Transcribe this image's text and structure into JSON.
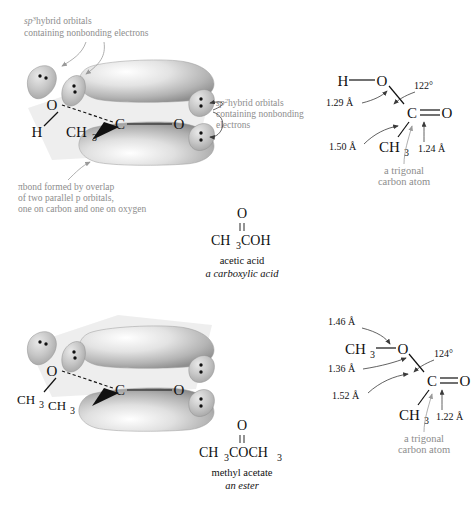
{
  "figure": {
    "background_color": "#ffffff",
    "text_color": "#111111",
    "gray_label_color": "#8d8d8d",
    "orbital_lobe_color": "#b9b9b9",
    "plane_color": "#ebebeb"
  },
  "panels": [
    {
      "id": "acetic-acid",
      "orbital_diagram": {
        "atoms": [
          {
            "symbol": "O",
            "sub": ""
          },
          {
            "symbol": "H",
            "sub": ""
          },
          {
            "symbol": "CH",
            "sub": "3"
          },
          {
            "symbol": "C",
            "sub": ""
          },
          {
            "symbol": "O",
            "sub": ""
          }
        ],
        "lone_pair_count": 4,
        "pi_lobes": 2
      },
      "annotations": [
        {
          "id": "sp3-label",
          "lines": [
            "hybrid orbitals",
            "containing nonbonding electrons"
          ],
          "prefix_base": "sp",
          "prefix_exp": "3"
        },
        {
          "id": "sp2-label",
          "lines": [
            "hybrid orbitals",
            "containing nonbonding",
            "electrons"
          ],
          "prefix_base": "sp",
          "prefix_exp": "2"
        },
        {
          "id": "pi-bond-label",
          "lines": [
            "bond formed by overlap",
            "of two parallel p orbitals,",
            "one on carbon and one on oxygen"
          ],
          "symbol": "π"
        }
      ],
      "structure": {
        "atoms": {
          "left": "H",
          "o_hydroxyl": "O",
          "carbon": "C",
          "o_carbonyl": "O",
          "methyl_base": "CH",
          "methyl_sub": "3"
        },
        "angle": "122°",
        "bond_lengths": [
          {
            "id": "o-h-to-c",
            "value": "1.29 Å"
          },
          {
            "id": "c-ch3",
            "value": "1.50 Å"
          },
          {
            "id": "c-double-o",
            "value": "1.24 Å"
          }
        ],
        "trigonal_note": [
          "a trigonal",
          "carbon atom"
        ]
      },
      "formula": {
        "top": "O",
        "double_bond_glyph": "‖",
        "condensed_base": "CH",
        "condensed_sub": "3",
        "condensed_tail": "COH",
        "name": "acetic acid",
        "class": "a carboxylic acid"
      }
    },
    {
      "id": "methyl-acetate",
      "orbital_diagram": {
        "atoms": [
          {
            "symbol": "O",
            "sub": ""
          },
          {
            "symbol": "CH",
            "sub": "3"
          },
          {
            "symbol": "CH",
            "sub": "3"
          },
          {
            "symbol": "C",
            "sub": ""
          },
          {
            "symbol": "O",
            "sub": ""
          }
        ],
        "lone_pair_count": 4,
        "pi_lobes": 2
      },
      "structure": {
        "atoms": {
          "left_base": "CH",
          "left_sub": "3",
          "o_ester": "O",
          "carbon": "C",
          "o_carbonyl": "O",
          "methyl_base": "CH",
          "methyl_sub": "3"
        },
        "angle": "124°",
        "bond_lengths": [
          {
            "id": "ch3-o",
            "value": "1.46 Å"
          },
          {
            "id": "o-c",
            "value": "1.36 Å"
          },
          {
            "id": "c-ch3",
            "value": "1.52 Å"
          },
          {
            "id": "c-double-o",
            "value": "1.22 Å"
          }
        ],
        "trigonal_note": [
          "a trigonal",
          "carbon atom"
        ]
      },
      "formula": {
        "top": "O",
        "double_bond_glyph": "‖",
        "condensed_base": "CH",
        "condensed_sub": "3",
        "condensed_tail": "COCH",
        "condensed_tail_sub": "3",
        "name": "methyl acetate",
        "class": "an ester"
      }
    }
  ]
}
